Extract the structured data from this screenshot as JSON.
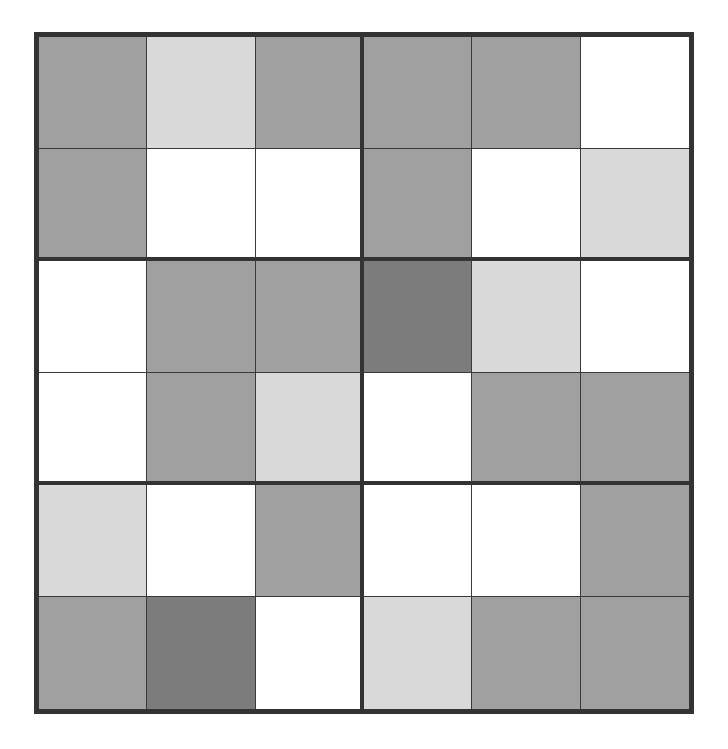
{
  "puzzle": {
    "type": "shaded-grid",
    "rows": 6,
    "cols": 6,
    "box_rows": 2,
    "box_cols": 3,
    "palette": {
      "W": "#ffffff",
      "L": "#d9d9d9",
      "M": "#a0a0a0",
      "D": "#7c7c7c"
    },
    "grid": [
      [
        "M",
        "L",
        "M",
        "M",
        "M",
        "W"
      ],
      [
        "M",
        "W",
        "W",
        "M",
        "W",
        "L"
      ],
      [
        "W",
        "M",
        "M",
        "D",
        "L",
        "W"
      ],
      [
        "W",
        "M",
        "L",
        "W",
        "M",
        "M"
      ],
      [
        "L",
        "W",
        "M",
        "W",
        "W",
        "M"
      ],
      [
        "M",
        "D",
        "W",
        "L",
        "M",
        "M"
      ]
    ]
  }
}
